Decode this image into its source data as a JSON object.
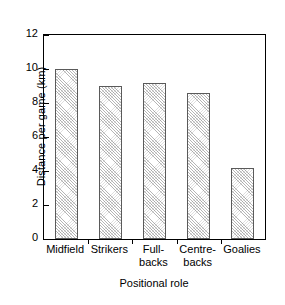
{
  "chart_data": {
    "type": "bar",
    "title": "",
    "xlabel": "Positional role",
    "ylabel": "Distance per game (km)",
    "categories": [
      "Midfield",
      "Strikers",
      "Full-\nbacks",
      "Centre-\nbacks",
      "Goalies"
    ],
    "values": [
      10.0,
      9.0,
      9.2,
      8.6,
      4.2
    ],
    "ylim": [
      0,
      12
    ],
    "yticks": [
      0,
      2,
      4,
      6,
      8,
      10,
      12
    ],
    "ytick_labels": [
      "0",
      "2",
      "4",
      "6",
      "8",
      "10",
      "12"
    ],
    "grid": false,
    "legend": null,
    "bar_fill": "diagonal-hatch",
    "bar_edge_color": "#5a5a5a",
    "axis_color": "#000000",
    "background_color": "#ffffff"
  }
}
